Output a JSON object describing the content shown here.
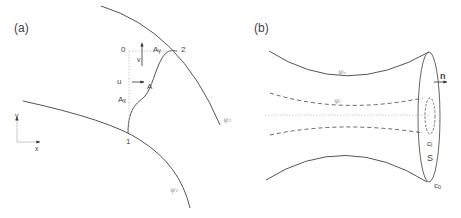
{
  "panel_a": {
    "label": "(a)",
    "curves": {
      "upper_streamline": "ψ₂",
      "lower_streamline": "ψ₁",
      "path": "A"
    },
    "points": {
      "origin": "0",
      "p1": "1",
      "p2": "2"
    },
    "labels": {
      "A_y": "Aᵧ",
      "A_x": "Aₓ",
      "A": "A",
      "u": "u",
      "v": "v"
    },
    "axes": {
      "x": "x",
      "y": "y"
    }
  },
  "panel_b": {
    "label": "(b)",
    "curves": {
      "outer_streamline": "ψₒ",
      "inner_streamline": "ψᵢ"
    },
    "labels": {
      "normal": "n",
      "inner_contour": "cᵢ",
      "surface": "S",
      "outer_contour": "cₒ"
    }
  },
  "colors": {
    "line": "#555555",
    "dotted": "#b0b0b0",
    "text": "#444444",
    "faint_text": "#9a9a9a"
  }
}
